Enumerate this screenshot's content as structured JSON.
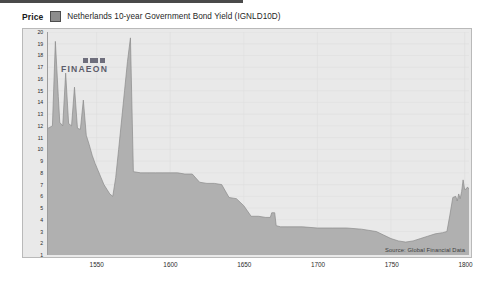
{
  "header": {
    "price_label": "Price",
    "series_label": "Netherlands 10-year Government Bond Yield (IGNLD10D)",
    "swatch_color": "#8d8d8d"
  },
  "watermark": {
    "text_left": "FIN",
    "text_mid": "AE",
    "text_right": "ON",
    "full": "FINAEON"
  },
  "source": {
    "text": "Source: Global Financial Data"
  },
  "chart_data": {
    "type": "area",
    "title": "Netherlands 10-year Government Bond Yield (IGNLD10D)",
    "xlabel": "",
    "ylabel": "Price",
    "xlim": [
      1517,
      1803
    ],
    "ylim": [
      1,
      20
    ],
    "grid": true,
    "legend_position": "top-left",
    "fill_color": "#b0b0b0",
    "line_color": "#8a8a8a",
    "background_color": "#e9e9e9",
    "ytick_labels": [
      20,
      19,
      18,
      17,
      16,
      15,
      14,
      13,
      12,
      11,
      10,
      9,
      8,
      7,
      6,
      5,
      4,
      3,
      2,
      1
    ],
    "xtick_labels": [
      1550,
      1600,
      1650,
      1700,
      1750,
      1800
    ],
    "series": [
      {
        "name": "Netherlands 10-year Government Bond Yield (IGNLD10D)",
        "x": [
          1517,
          1520,
          1522,
          1524,
          1525,
          1527,
          1529,
          1531,
          1533,
          1535,
          1537,
          1539,
          1541,
          1543,
          1545,
          1547,
          1549,
          1551,
          1553,
          1555,
          1557,
          1559,
          1561,
          1563,
          1565,
          1567,
          1569,
          1571,
          1573,
          1575,
          1580,
          1585,
          1590,
          1595,
          1600,
          1605,
          1610,
          1615,
          1620,
          1625,
          1630,
          1635,
          1640,
          1645,
          1650,
          1655,
          1660,
          1665,
          1668,
          1669,
          1671,
          1672,
          1675,
          1680,
          1690,
          1700,
          1710,
          1720,
          1730,
          1740,
          1745,
          1750,
          1755,
          1760,
          1765,
          1770,
          1775,
          1780,
          1785,
          1788,
          1790,
          1792,
          1794,
          1795,
          1796,
          1797,
          1798,
          1799,
          1800,
          1801,
          1802,
          1803
        ],
        "y": [
          11.8,
          12.0,
          19.2,
          14.5,
          12.3,
          12.0,
          16.5,
          12.2,
          12.0,
          15.3,
          11.8,
          11.7,
          14.2,
          11.2,
          10.4,
          9.5,
          8.8,
          8.2,
          7.6,
          7.0,
          6.6,
          6.2,
          6.0,
          7.6,
          10.0,
          12.5,
          15.0,
          17.5,
          19.5,
          8.1,
          8.0,
          8.0,
          8.0,
          8.0,
          8.0,
          8.0,
          7.9,
          7.9,
          7.2,
          7.1,
          7.1,
          7.0,
          5.9,
          5.8,
          5.2,
          4.3,
          4.3,
          4.2,
          4.2,
          4.6,
          4.6,
          3.5,
          3.4,
          3.4,
          3.4,
          3.3,
          3.3,
          3.3,
          3.2,
          3.0,
          2.7,
          2.4,
          2.2,
          2.1,
          2.2,
          2.4,
          2.6,
          2.8,
          2.9,
          3.0,
          4.4,
          5.9,
          6.0,
          5.6,
          6.2,
          5.8,
          6.4,
          7.4,
          6.6,
          6.6,
          6.8,
          6.6
        ]
      }
    ]
  }
}
